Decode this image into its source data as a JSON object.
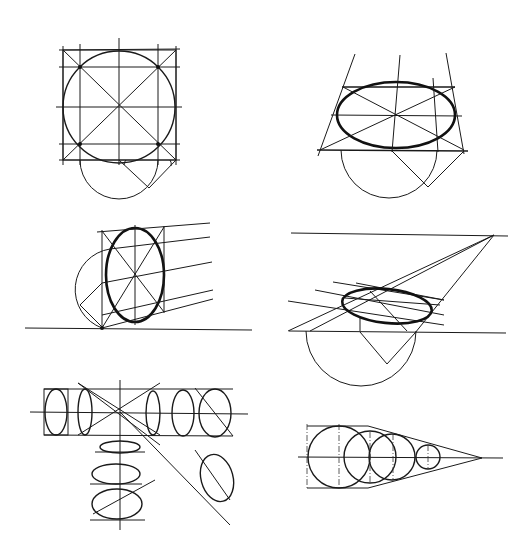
{
  "figure": {
    "panels": [
      {
        "id": "square-circle",
        "label": "Circle inscribed in square with diagonals and half-circle construction"
      },
      {
        "id": "horizontal-ellipse",
        "label": "Horizontal ellipse in perspective square with converging lines"
      },
      {
        "id": "vertical-ellipse",
        "label": "Vertical ellipse with receding lines and ground line"
      },
      {
        "id": "vanishing-point-ellipse",
        "label": "Ellipse on ground plane converging to vanishing point on horizon"
      },
      {
        "id": "ellipse-array",
        "label": "Array of ellipses around a central point in various orientations"
      },
      {
        "id": "receding-circles",
        "label": "Series of circles receding to a single vanishing point"
      }
    ],
    "colors": {
      "ink": "#111111",
      "background": "#ffffff"
    }
  }
}
